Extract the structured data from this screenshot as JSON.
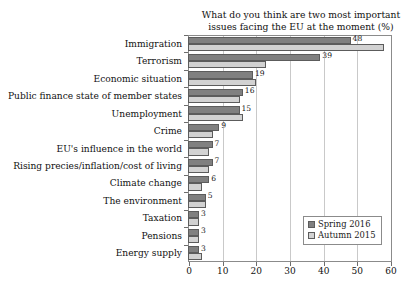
{
  "chart_data": {
    "type": "bar",
    "orientation": "horizontal",
    "title": "What do you think are two most important issues facing the EU at the moment (%)",
    "title_lines": [
      "What do you think are two most important",
      "issues facing the EU at the moment (%)"
    ],
    "xlabel": "",
    "ylabel": "",
    "xlim": [
      0,
      60
    ],
    "xticks": [
      0,
      10,
      20,
      30,
      40,
      50,
      60
    ],
    "grid": true,
    "grid_axis": "x",
    "legend_position": "lower right",
    "categories": [
      "Immigration",
      "Terrorism",
      "Economic situation",
      "Public finance state of member states",
      "Unemployment",
      "Crime",
      "EU's influence in the world",
      "Rising precies/inflation/cost of living",
      "Climate change",
      "The environment",
      "Taxation",
      "Pensions",
      "Energy supply"
    ],
    "series": [
      {
        "name": "Spring 2016",
        "color": "#808080",
        "values": [
          48,
          39,
          19,
          16,
          15,
          9,
          7,
          7,
          6,
          5,
          3,
          3,
          3
        ],
        "labels": [
          "48",
          "39",
          "19",
          "16",
          "15",
          "9",
          "7",
          "7",
          "6",
          "5",
          "3",
          "3",
          "3"
        ]
      },
      {
        "name": "Autumn 2015",
        "color": "#d2d2d2",
        "values": [
          58,
          23,
          20,
          15,
          16,
          7,
          6,
          6,
          4,
          5,
          3,
          3,
          4
        ],
        "labels": [
          "",
          "",
          "",
          "",
          "",
          "",
          "",
          "",
          "",
          "",
          "",
          "",
          ""
        ]
      }
    ]
  },
  "legend": {
    "entries": [
      {
        "label": "Spring 2016",
        "swatch": "spring"
      },
      {
        "label": "Autumn 2015",
        "swatch": "autumn"
      }
    ]
  }
}
